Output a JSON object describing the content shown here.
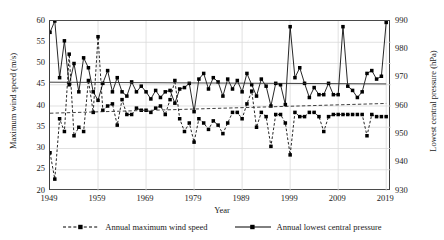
{
  "chart_data": {
    "type": "line",
    "title": "",
    "xlabel": "Year",
    "ylabel_left": "Maximum wind speed (m/s)",
    "ylabel_right": "Lowest central pressure (hPa)",
    "grid": true,
    "legend_position": "bottom",
    "xlim": [
      1949,
      2020
    ],
    "xticks": [
      "1949",
      "1959",
      "1969",
      "1979",
      "1989",
      "1999",
      "2009",
      "2019"
    ],
    "xtick_values": [
      1949,
      1959,
      1969,
      1979,
      1989,
      1999,
      2009,
      2019
    ],
    "ylim_left": [
      20,
      60
    ],
    "yticks_left": [
      "20",
      "25",
      "30",
      "35",
      "40",
      "45",
      "50",
      "55",
      "60"
    ],
    "ytick_values_left": [
      20,
      25,
      30,
      35,
      40,
      45,
      50,
      55,
      60
    ],
    "ylim_right": [
      930,
      990
    ],
    "yticks_right": [
      "930",
      "940",
      "950",
      "960",
      "970",
      "980",
      "990"
    ],
    "ytick_values_right": [
      930,
      940,
      950,
      960,
      970,
      980,
      990
    ],
    "x": [
      1949,
      1950,
      1951,
      1952,
      1953,
      1954,
      1955,
      1956,
      1957,
      1958,
      1959,
      1960,
      1961,
      1962,
      1963,
      1964,
      1965,
      1966,
      1967,
      1968,
      1969,
      1970,
      1971,
      1972,
      1973,
      1974,
      1975,
      1976,
      1977,
      1978,
      1979,
      1980,
      1981,
      1982,
      1983,
      1984,
      1985,
      1986,
      1987,
      1988,
      1989,
      1990,
      1991,
      1992,
      1993,
      1994,
      1995,
      1996,
      1997,
      1998,
      1999,
      2000,
      2001,
      2002,
      2003,
      2004,
      2005,
      2006,
      2007,
      2008,
      2009,
      2010,
      2011,
      2012,
      2013,
      2014,
      2015,
      2016,
      2017,
      2018,
      2019
    ],
    "series": [
      {
        "name": "Annual maximum wind speed",
        "axis": "left",
        "style": "dashed",
        "marker": "square",
        "values": [
          29.0,
          22.8,
          37.0,
          34.0,
          52.2,
          33.0,
          35.0,
          34.0,
          46.0,
          38.5,
          56.3,
          39.0,
          40.0,
          40.5,
          35.5,
          41.5,
          38.0,
          38.0,
          39.5,
          39.0,
          39.0,
          38.5,
          39.5,
          40.0,
          38.0,
          41.5,
          46.0,
          37.0,
          34.0,
          36.0,
          31.5,
          37.0,
          36.0,
          34.5,
          36.5,
          35.5,
          33.5,
          36.0,
          38.5,
          38.5,
          37.0,
          40.5,
          43.5,
          35.0,
          38.5,
          37.5,
          30.5,
          38.0,
          38.0,
          36.0,
          28.5,
          38.5,
          37.5,
          37.5,
          38.5,
          38.5,
          37.5,
          34.0,
          37.5,
          38.0,
          38.0,
          38.0,
          38.0,
          38.0,
          38.0,
          38.0,
          33.0,
          38.0,
          37.5,
          37.5,
          37.5
        ]
      },
      {
        "name": "Annual lowest central pressure",
        "axis": "right",
        "style": "solid",
        "marker": "square",
        "values": [
          986.0,
          990.0,
          970.0,
          983.0,
          967.5,
          975.0,
          965.0,
          977.0,
          973.5,
          965.0,
          962.0,
          968.0,
          972.5,
          965.0,
          970.0,
          965.0,
          963.5,
          968.5,
          965.0,
          967.0,
          965.0,
          962.5,
          965.5,
          963.0,
          965.0,
          965.5,
          961.0,
          966.0,
          966.5,
          968.0,
          958.0,
          969.5,
          971.5,
          966.0,
          970.0,
          968.5,
          963.5,
          969.5,
          966.0,
          969.0,
          965.0,
          971.5,
          967.5,
          963.5,
          969.5,
          967.0,
          960.0,
          968.0,
          967.5,
          960.5,
          988.0,
          970.0,
          973.5,
          968.0,
          963.0,
          966.5,
          964.0,
          964.0,
          968.0,
          964.0,
          964.0,
          988.0,
          967.0,
          965.5,
          963.0,
          965.0,
          971.5,
          972.5,
          969.5,
          970.5,
          989.5
        ]
      }
    ],
    "trendlines": [
      {
        "name": "wind-speed-trend",
        "axis": "left",
        "style": "dashed",
        "x": [
          1949,
          2019
        ],
        "y": [
          38.3,
          40.6
        ]
      },
      {
        "name": "pressure-trend",
        "axis": "left",
        "style": "solid",
        "x": [
          1949,
          2019
        ],
        "y": [
          45.6,
          45.2
        ]
      }
    ]
  },
  "legend": {
    "items": [
      {
        "label": "Annual maximum wind speed",
        "style": "dashed",
        "marker": "square"
      },
      {
        "label": "Annual lowest central pressure",
        "style": "solid",
        "marker": "square"
      }
    ]
  },
  "colors": {
    "series": "#000000",
    "axis": "#3d3d3d",
    "grid": "#d9d9d9",
    "text": "#1a1a1a",
    "background": "#ffffff"
  }
}
